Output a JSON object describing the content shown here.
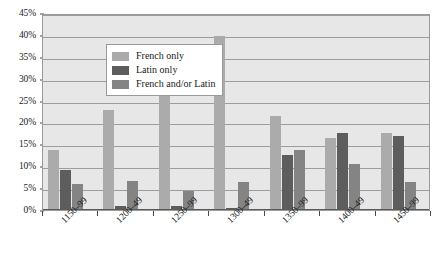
{
  "chart_data": {
    "type": "bar",
    "title": "",
    "subtitle": "",
    "xlabel": "",
    "ylabel": "",
    "ylim": [
      0,
      45
    ],
    "ytick_labels": [
      "45%",
      "40%",
      "35%",
      "30%",
      "25%",
      "20%",
      "15%",
      "10%",
      "5%",
      "0%"
    ],
    "ytick_values": [
      45,
      40,
      35,
      30,
      25,
      20,
      15,
      10,
      5,
      0
    ],
    "grid": true,
    "legend_position": "upper-left-inside",
    "categories": [
      "1150–99",
      "1200–49",
      "1250–99",
      "1300–49",
      "1350–99",
      "1400–49",
      "1450–99"
    ],
    "series": [
      {
        "name": "French only",
        "color": "#ababab",
        "values": [
          13.6,
          22.8,
          26.5,
          39.8,
          21.5,
          16.4,
          17.7
        ]
      },
      {
        "name": "Latin only",
        "color": "#5d5d5d",
        "values": [
          9.1,
          1.0,
          0.9,
          0.5,
          12.5,
          17.5,
          17.0
        ]
      },
      {
        "name": "French and/or Latin",
        "color": "#848484",
        "values": [
          5.9,
          6.7,
          4.3,
          6.4,
          13.8,
          10.6,
          6.4
        ]
      }
    ],
    "plot_background": "#e7e7e7",
    "gridline_color": "#9d9d9d",
    "axis_color": "#4a4a4a"
  },
  "legend": {
    "items": [
      {
        "label": "French only"
      },
      {
        "label": "Latin only"
      },
      {
        "label": "French and/or Latin"
      }
    ]
  }
}
